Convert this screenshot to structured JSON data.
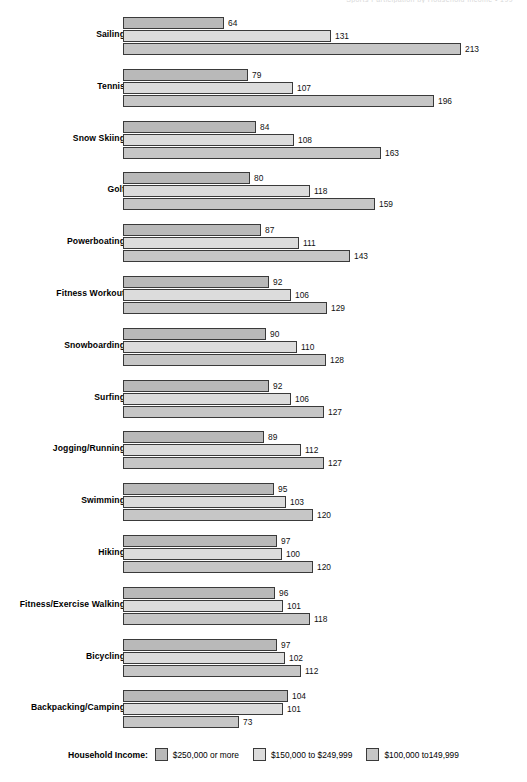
{
  "header": {
    "running_head": "Sports Participation by Household Income  •  199"
  },
  "legend": {
    "title": "Household Income:",
    "items": [
      {
        "label": "$250,000 or more",
        "color": "#b9b9b9"
      },
      {
        "label": "$150,000 to $249,999",
        "color": "#dcdcdc"
      },
      {
        "label": "$100,000 to149,999",
        "color": "#c6c6c6"
      }
    ]
  },
  "chart_data": {
    "type": "bar",
    "orientation": "horizontal",
    "title": "",
    "xlabel": "",
    "ylabel": "",
    "grid": false,
    "legend_position": "bottom",
    "xlim": [
      0,
      213
    ],
    "categories": [
      "Sailing",
      "Tennis",
      "Snow Skiing",
      "Golf",
      "Powerboating",
      "Fitness Workout",
      "Snowboarding",
      "Surfing",
      "Jogging/Running",
      "Swimming",
      "Hiking",
      "Fitness/Exercise Walking",
      "Bicycling",
      "Backpacking/Camping"
    ],
    "series": [
      {
        "name": "$250,000 or more",
        "color": "#b9b9b9",
        "values": [
          64,
          79,
          84,
          80,
          87,
          92,
          90,
          92,
          89,
          95,
          97,
          96,
          97,
          104
        ]
      },
      {
        "name": "$150,000 to $249,999",
        "color": "#dcdcdc",
        "values": [
          131,
          107,
          108,
          118,
          111,
          106,
          110,
          106,
          112,
          103,
          100,
          101,
          102,
          101
        ]
      },
      {
        "name": "$100,000 to149,999",
        "color": "#c6c6c6",
        "values": [
          213,
          196,
          163,
          159,
          143,
          129,
          128,
          127,
          127,
          120,
          120,
          118,
          112,
          73
        ]
      }
    ]
  }
}
